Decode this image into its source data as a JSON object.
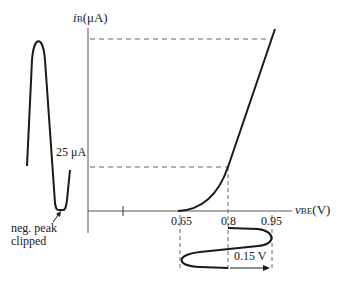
{
  "figure": {
    "y_axis": {
      "symbol": "i",
      "subscript": "B",
      "unit": "(μA)"
    },
    "x_axis": {
      "symbol": "v",
      "subscript": "BE",
      "unit": "(V)",
      "ticks": [
        "0.65",
        "0.8",
        "0.95"
      ]
    },
    "annotations": {
      "current_level": "25 μA",
      "clipping_note_line1": "neg. peak",
      "clipping_note_line2": "clipped",
      "swing_label": "0.15 V"
    },
    "colors": {
      "curve": "#1a1a1a",
      "axis": "#555555",
      "dashed": "#666666"
    }
  }
}
